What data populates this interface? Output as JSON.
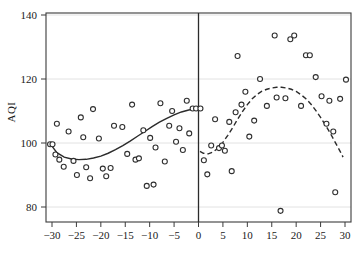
{
  "chart_data": {
    "type": "scatter",
    "title": "",
    "subtitle": "",
    "xlabel": "",
    "ylabel": "AQI",
    "xlim": [
      -32,
      31
    ],
    "ylim": [
      74,
      143
    ],
    "xticks": [
      -30,
      -25,
      -20,
      -15,
      -10,
      -5,
      0,
      5,
      10,
      15,
      20,
      25,
      30
    ],
    "yticks": [
      80,
      100,
      120,
      140
    ],
    "xtick_labels": [
      "-30",
      "-25",
      "-20",
      "-15",
      "-10",
      "-5",
      "0",
      "5",
      "10",
      "15",
      "20",
      "25",
      "30"
    ],
    "ytick_labels": [
      "80",
      "100",
      "120",
      "140"
    ],
    "grid": "horizontal",
    "legend": "none",
    "annotations": [
      {
        "name": "cutoff-line",
        "type": "vline",
        "x": 0,
        "label": ""
      }
    ],
    "series": [
      {
        "name": "observations-left",
        "type": "scatter",
        "marker": "open-circle",
        "color": "#2f2f2f",
        "points": [
          [
            -30.4,
            99.6
          ],
          [
            -29.9,
            99.6
          ],
          [
            -29.3,
            96.4
          ],
          [
            -29.0,
            106.0
          ],
          [
            -28.5,
            94.8
          ],
          [
            -27.6,
            92.6
          ],
          [
            -26.6,
            103.6
          ],
          [
            -25.6,
            94.4
          ],
          [
            -24.9,
            90.0
          ],
          [
            -24.1,
            108.0
          ],
          [
            -23.6,
            101.8
          ],
          [
            -23.0,
            92.4
          ],
          [
            -22.2,
            89.0
          ],
          [
            -21.6,
            110.6
          ],
          [
            -20.4,
            101.4
          ],
          [
            -19.6,
            92.0
          ],
          [
            -18.9,
            89.6
          ],
          [
            -18.0,
            92.2
          ],
          [
            -17.3,
            105.4
          ],
          [
            -15.6,
            105.0
          ],
          [
            -14.6,
            96.6
          ],
          [
            -13.6,
            112.0
          ],
          [
            -12.9,
            94.8
          ],
          [
            -12.2,
            95.2
          ],
          [
            -11.3,
            104.0
          ],
          [
            -10.6,
            86.6
          ],
          [
            -9.9,
            101.6
          ],
          [
            -9.2,
            87.0
          ],
          [
            -8.8,
            98.6
          ],
          [
            -7.8,
            112.4
          ],
          [
            -6.9,
            94.2
          ],
          [
            -6.0,
            105.4
          ],
          [
            -5.4,
            110.0
          ],
          [
            -4.6,
            100.4
          ],
          [
            -3.9,
            104.6
          ],
          [
            -3.2,
            97.8
          ],
          [
            -2.4,
            113.2
          ],
          [
            -1.9,
            103.0
          ],
          [
            -1.2,
            110.8
          ],
          [
            -0.5,
            110.8
          ]
        ]
      },
      {
        "name": "observations-right",
        "type": "scatter",
        "marker": "open-circle",
        "color": "#2f2f2f",
        "points": [
          [
            0.4,
            110.8
          ],
          [
            1.1,
            94.6
          ],
          [
            1.8,
            90.2
          ],
          [
            2.6,
            99.2
          ],
          [
            3.4,
            107.4
          ],
          [
            4.2,
            98.4
          ],
          [
            4.8,
            99.2
          ],
          [
            5.4,
            97.6
          ],
          [
            6.3,
            106.6
          ],
          [
            6.8,
            91.2
          ],
          [
            7.6,
            109.6
          ],
          [
            8.0,
            127.2
          ],
          [
            8.8,
            112.0
          ],
          [
            9.6,
            116.0
          ],
          [
            10.4,
            102.0
          ],
          [
            11.4,
            107.0
          ],
          [
            12.6,
            120.0
          ],
          [
            14.0,
            111.6
          ],
          [
            15.6,
            133.6
          ],
          [
            16.0,
            114.2
          ],
          [
            16.8,
            78.8
          ],
          [
            17.8,
            114.0
          ],
          [
            18.8,
            132.4
          ],
          [
            19.6,
            133.6
          ],
          [
            21.0,
            111.6
          ],
          [
            22.0,
            127.4
          ],
          [
            22.8,
            127.4
          ],
          [
            24.0,
            120.6
          ],
          [
            25.2,
            114.6
          ],
          [
            26.2,
            106.0
          ],
          [
            26.8,
            113.2
          ],
          [
            27.6,
            103.6
          ],
          [
            28.0,
            84.6
          ],
          [
            29.0,
            113.8
          ],
          [
            30.2,
            119.8
          ]
        ]
      },
      {
        "name": "fit-left",
        "type": "line",
        "style": "solid",
        "color": "#2b2b2b",
        "points": [
          [
            -30.2,
            99.4
          ],
          [
            -29.0,
            97.0
          ],
          [
            -27.5,
            95.6
          ],
          [
            -26.0,
            95.0
          ],
          [
            -24.5,
            94.8
          ],
          [
            -23.0,
            94.9
          ],
          [
            -21.5,
            95.3
          ],
          [
            -20.0,
            95.9
          ],
          [
            -18.5,
            96.8
          ],
          [
            -17.0,
            97.9
          ],
          [
            -15.5,
            99.2
          ],
          [
            -14.0,
            100.6
          ],
          [
            -12.5,
            102.1
          ],
          [
            -11.0,
            103.6
          ],
          [
            -9.5,
            105.1
          ],
          [
            -8.0,
            106.5
          ],
          [
            -6.5,
            107.7
          ],
          [
            -5.0,
            108.8
          ],
          [
            -3.5,
            109.7
          ],
          [
            -2.0,
            110.3
          ],
          [
            -1.0,
            110.6
          ],
          [
            -0.3,
            110.7
          ]
        ]
      },
      {
        "name": "fit-right",
        "type": "line",
        "style": "dashed",
        "color": "#2b2b2b",
        "points": [
          [
            0.3,
            97.4
          ],
          [
            1.0,
            96.8
          ],
          [
            2.0,
            96.6
          ],
          [
            3.0,
            97.2
          ],
          [
            4.0,
            98.4
          ],
          [
            5.0,
            100.2
          ],
          [
            6.0,
            102.4
          ],
          [
            7.0,
            104.8
          ],
          [
            8.0,
            107.4
          ],
          [
            9.0,
            109.8
          ],
          [
            10.0,
            112.0
          ],
          [
            11.0,
            113.8
          ],
          [
            12.0,
            115.2
          ],
          [
            13.0,
            116.2
          ],
          [
            14.0,
            116.8
          ],
          [
            15.0,
            117.2
          ],
          [
            16.0,
            117.4
          ],
          [
            17.0,
            117.4
          ],
          [
            18.0,
            117.2
          ],
          [
            19.0,
            116.8
          ],
          [
            20.0,
            116.1
          ],
          [
            21.0,
            115.1
          ],
          [
            22.0,
            113.8
          ],
          [
            23.0,
            112.2
          ],
          [
            24.0,
            110.2
          ],
          [
            25.0,
            108.0
          ],
          [
            26.0,
            105.6
          ],
          [
            27.0,
            103.0
          ],
          [
            28.0,
            100.2
          ],
          [
            29.0,
            97.4
          ],
          [
            29.6,
            95.6
          ]
        ]
      }
    ]
  }
}
